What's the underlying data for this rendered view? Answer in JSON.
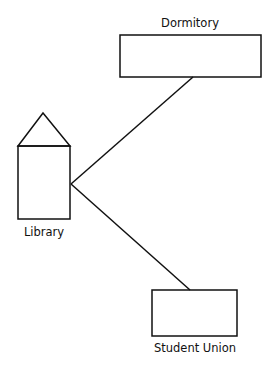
{
  "diagram": {
    "nodes": [
      {
        "id": "dormitory",
        "label": "Dormitory",
        "shape": "rectangle"
      },
      {
        "id": "library",
        "label": "Library",
        "shape": "house"
      },
      {
        "id": "student_union",
        "label": "Student Union",
        "shape": "rectangle"
      }
    ],
    "edges": [
      {
        "from": "library",
        "to": "dormitory"
      },
      {
        "from": "library",
        "to": "student_union"
      }
    ],
    "colors": {
      "stroke": "#111111",
      "background": "#ffffff"
    }
  }
}
